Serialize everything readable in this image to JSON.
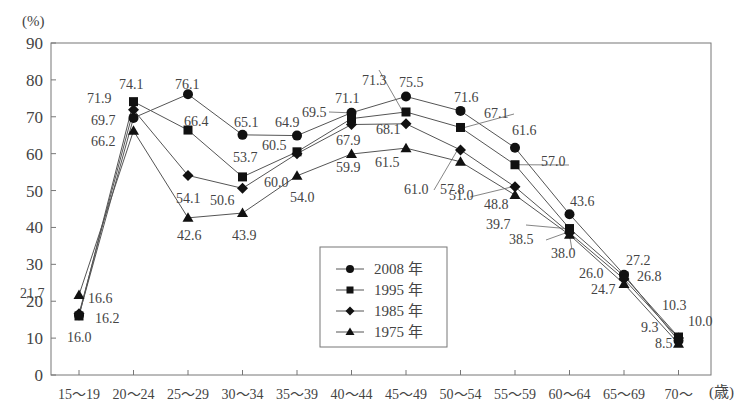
{
  "chart_data": {
    "type": "line",
    "title": "",
    "ylabel": "(%)",
    "xlabel": "(歳)",
    "ylim": [
      0,
      90
    ],
    "yticks": [
      0,
      10,
      20,
      30,
      40,
      50,
      60,
      70,
      80,
      90
    ],
    "grid": false,
    "legend_position": "inside-bottom-center",
    "categories": [
      "15～19",
      "20～24",
      "25～29",
      "30～34",
      "35～39",
      "40～44",
      "45～49",
      "50～54",
      "55～59",
      "60～64",
      "65～69",
      "70～"
    ],
    "series": [
      {
        "name": "2008 年",
        "marker": "circle",
        "values": [
          16.2,
          69.7,
          76.1,
          65.1,
          64.9,
          71.1,
          75.5,
          71.6,
          61.6,
          43.6,
          27.2,
          9.3
        ]
      },
      {
        "name": "1995 年",
        "marker": "square",
        "values": [
          16.0,
          74.1,
          66.4,
          53.7,
          60.5,
          69.5,
          71.3,
          67.1,
          57.0,
          39.7,
          26.8,
          10.3
        ]
      },
      {
        "name": "1985 年",
        "marker": "diamond",
        "values": [
          16.6,
          71.9,
          54.1,
          50.6,
          60.0,
          67.9,
          68.1,
          61.0,
          51.0,
          38.5,
          26.0,
          10.0
        ]
      },
      {
        "name": "1975 年",
        "marker": "triangle",
        "values": [
          21.7,
          66.2,
          42.6,
          43.9,
          54.0,
          59.9,
          61.5,
          57.8,
          48.8,
          38.0,
          24.7,
          8.5
        ]
      }
    ]
  },
  "axis": {
    "y_unit": "(%)",
    "x_unit": "(歳)",
    "x_tick_labels": [
      "15～19",
      "20～24",
      "25～29",
      "30～34",
      "35～39",
      "40～44",
      "45～49",
      "50～54",
      "55～59",
      "60～64",
      "65～69",
      "70～"
    ]
  },
  "legend": {
    "items": [
      "2008 年",
      "1995 年",
      "1985 年",
      "1975 年"
    ]
  },
  "annotations": [
    {
      "text": "21.7",
      "x": 20,
      "y": 298
    },
    {
      "text": "16.6",
      "x": 88,
      "y": 303
    },
    {
      "text": "16.2",
      "x": 95,
      "y": 323
    },
    {
      "text": "16.0",
      "x": 67,
      "y": 342
    },
    {
      "text": "71.9",
      "x": 87,
      "y": 103
    },
    {
      "text": "74.1",
      "x": 119,
      "y": 89
    },
    {
      "text": "69.7",
      "x": 91,
      "y": 125
    },
    {
      "text": "66.2",
      "x": 91,
      "y": 146
    },
    {
      "text": "76.1",
      "x": 175,
      "y": 89
    },
    {
      "text": "66.4",
      "x": 184,
      "y": 126
    },
    {
      "text": "54.1",
      "x": 176,
      "y": 203
    },
    {
      "text": "42.6",
      "x": 177,
      "y": 240
    },
    {
      "text": "65.1",
      "x": 234,
      "y": 127
    },
    {
      "text": "53.7",
      "x": 233,
      "y": 162
    },
    {
      "text": "50.6",
      "x": 210,
      "y": 205
    },
    {
      "text": "43.9",
      "x": 232,
      "y": 240
    },
    {
      "text": "64.9",
      "x": 275,
      "y": 127
    },
    {
      "text": "60.5",
      "x": 262,
      "y": 150
    },
    {
      "text": "60.0",
      "x": 264,
      "y": 187
    },
    {
      "text": "54.0",
      "x": 290,
      "y": 202
    },
    {
      "text": "69.5",
      "x": 302,
      "y": 117
    },
    {
      "text": "71.1",
      "x": 335,
      "y": 103
    },
    {
      "text": "67.9",
      "x": 336,
      "y": 145
    },
    {
      "text": "59.9",
      "x": 336,
      "y": 172
    },
    {
      "text": "71.3",
      "x": 362,
      "y": 85
    },
    {
      "text": "75.5",
      "x": 399,
      "y": 87
    },
    {
      "text": "68.1",
      "x": 376,
      "y": 134
    },
    {
      "text": "61.5",
      "x": 375,
      "y": 167
    },
    {
      "text": "61.0",
      "x": 404,
      "y": 194
    },
    {
      "text": "57.8",
      "x": 440,
      "y": 194
    },
    {
      "text": "71.6",
      "x": 454,
      "y": 102
    },
    {
      "text": "67.1",
      "x": 484,
      "y": 118
    },
    {
      "text": "51.0",
      "x": 449,
      "y": 200
    },
    {
      "text": "48.8",
      "x": 484,
      "y": 209
    },
    {
      "text": "61.6",
      "x": 512,
      "y": 135
    },
    {
      "text": "57.0",
      "x": 541,
      "y": 166
    },
    {
      "text": "43.6",
      "x": 570,
      "y": 206
    },
    {
      "text": "39.7",
      "x": 486,
      "y": 229
    },
    {
      "text": "38.5",
      "x": 509,
      "y": 244
    },
    {
      "text": "38.0",
      "x": 551,
      "y": 258
    },
    {
      "text": "26.0",
      "x": 579,
      "y": 278
    },
    {
      "text": "27.2",
      "x": 626,
      "y": 265
    },
    {
      "text": "24.7",
      "x": 591,
      "y": 294
    },
    {
      "text": "26.8",
      "x": 637,
      "y": 281
    },
    {
      "text": "10.3",
      "x": 662,
      "y": 310
    },
    {
      "text": "10.0",
      "x": 688,
      "y": 326
    },
    {
      "text": "9.3",
      "x": 641,
      "y": 332
    },
    {
      "text": "8.5",
      "x": 655,
      "y": 348
    }
  ]
}
